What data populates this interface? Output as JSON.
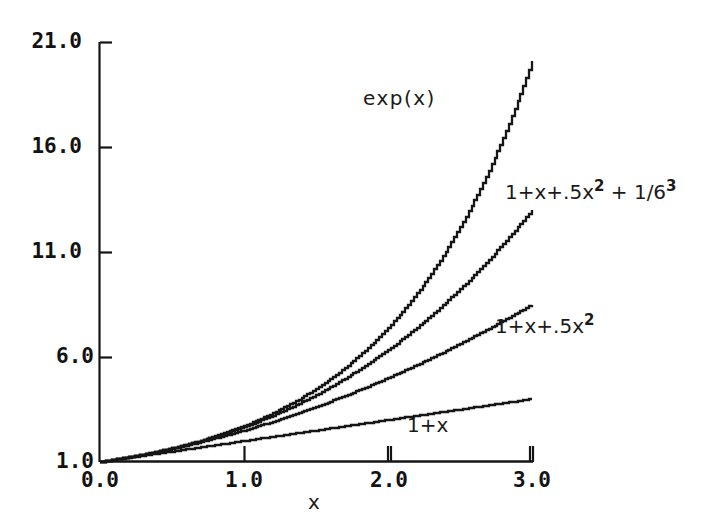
{
  "chart_data": {
    "type": "line",
    "title": "",
    "subtitle": "",
    "xlabel": "x",
    "ylabel": "",
    "xlim": [
      0.0,
      3.0
    ],
    "ylim": [
      1.0,
      21.0
    ],
    "grid": false,
    "legend_position": "inline-annotations",
    "xticks": [
      "0.0",
      "1.0",
      "2.0",
      "3.0"
    ],
    "xtick_values": [
      0.0,
      1.0,
      2.0,
      3.0
    ],
    "yticks": [
      "1.0",
      "6.0",
      "11.0",
      "16.0",
      "21.0"
    ],
    "ytick_values": [
      1.0,
      6.0,
      11.0,
      16.0,
      21.0
    ],
    "x": [
      0.0,
      0.15,
      0.3,
      0.45,
      0.6,
      0.75,
      0.9,
      1.05,
      1.2,
      1.35,
      1.5,
      1.65,
      1.8,
      1.95,
      2.1,
      2.25,
      2.4,
      2.55,
      2.7,
      2.85,
      3.0
    ],
    "series": [
      {
        "name": "exp(x)",
        "label": "exp(x)",
        "values": [
          1.0,
          1.16,
          1.35,
          1.57,
          1.82,
          2.12,
          2.46,
          2.86,
          3.32,
          3.86,
          4.48,
          5.21,
          6.05,
          7.03,
          8.17,
          9.49,
          11.02,
          12.81,
          14.88,
          17.29,
          20.09
        ]
      },
      {
        "name": "cubic",
        "label": "1+x+.5x² + 1/6",
        "label_exponent_2": "2",
        "label_exponent_3": "3",
        "values": [
          1.0,
          1.1616,
          1.3485,
          1.5672,
          1.816,
          2.1328,
          2.5065,
          2.8571,
          3.448,
          4.0224,
          4.75,
          5.5378,
          6.412,
          7.4291,
          8.6085,
          9.9727,
          11.536,
          13.3166,
          15.3315,
          17.6001,
          20.141
        ]
      },
      {
        "name": "quadratic",
        "label": "1+x+.5x²",
        "label_exponent_2": "2",
        "values": [
          1.0,
          1.1613,
          1.345,
          1.5513,
          1.78,
          2.0313,
          2.305,
          2.6013,
          2.92,
          3.2613,
          3.625,
          4.0113,
          4.42,
          4.8513,
          5.305,
          5.7813,
          6.28,
          6.8013,
          7.345,
          7.9113,
          8.5
        ]
      },
      {
        "name": "linear",
        "label": "1+x",
        "values": [
          1.0,
          1.15,
          1.3,
          1.45,
          1.6,
          1.75,
          1.9,
          2.05,
          2.2,
          2.35,
          2.5,
          2.65,
          2.8,
          2.95,
          3.1,
          3.25,
          3.4,
          3.55,
          3.7,
          3.85,
          4.0
        ]
      }
    ],
    "annotations": [
      {
        "text": "exp(x)",
        "x": 1.5,
        "y": 17.2
      },
      {
        "text": "1+x+.5x² + 1/6",
        "x": 2.35,
        "y": 13.6
      },
      {
        "text": "1+x+.5x²",
        "x": 2.65,
        "y": 7.7
      },
      {
        "text": "1+x",
        "x": 2.2,
        "y": 3.1
      }
    ]
  },
  "axes": {
    "y_tick_labels": [
      "21.0",
      "16.0",
      "11.0",
      "6.0",
      "1.0"
    ],
    "x_tick_labels": [
      "0.0",
      "1.0",
      "2.0",
      "3.0"
    ],
    "x_axis_name": "x"
  },
  "annotations": {
    "exp_label": "exp(x)",
    "cubic_prefix": "1+x+.5x",
    "cubic_sup2": "2",
    "cubic_mid": " + 1/6",
    "cubic_sup3": "3",
    "quadratic_prefix": "1+x+.5x",
    "quadratic_sup2": "2",
    "linear_label": "1+x"
  },
  "style": {
    "background": "#ffffff",
    "ink": "#121212",
    "curve_color": "#1a1a1a"
  }
}
